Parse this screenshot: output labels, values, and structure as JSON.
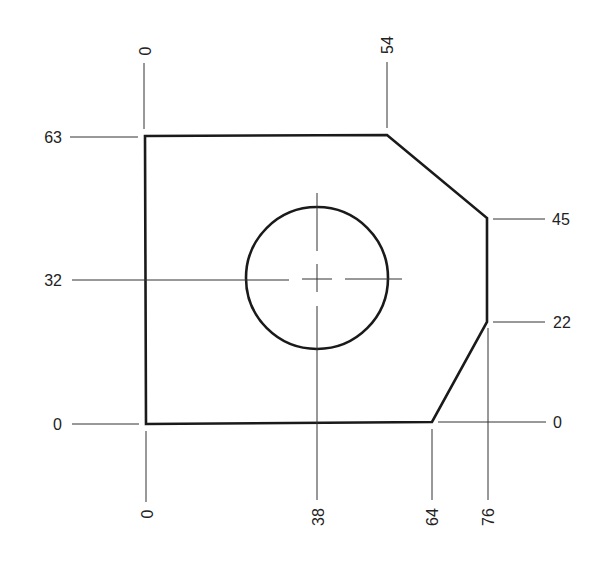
{
  "drawing": {
    "type": "ordinate-dimensioned part drawing",
    "units": "mm (implied)",
    "colors": {
      "outline": "#1a1a1a",
      "extension_lines": "#333333",
      "text": "#222222",
      "background": "#ffffff"
    },
    "top_labels": {
      "origin_x": "0",
      "chamfer_start_x": "54"
    },
    "left_labels": {
      "top_y": "63",
      "hole_center_y": "32",
      "origin_y": "0"
    },
    "right_labels": {
      "chamfer_end_y": "45",
      "lower_chamfer_y": "22",
      "origin_y": "0"
    },
    "bottom_labels": {
      "origin_x": "0",
      "hole_center_x": "38",
      "lower_chamfer_x": "64",
      "right_edge_x": "76"
    },
    "outline_points": [
      {
        "x": 0,
        "y": 0
      },
      {
        "x": 0,
        "y": 63
      },
      {
        "x": 54,
        "y": 63
      },
      {
        "x": 76,
        "y": 45
      },
      {
        "x": 76,
        "y": 22
      },
      {
        "x": 64,
        "y": 0
      }
    ],
    "hole": {
      "center_x": 38,
      "center_y": 32,
      "diameter_approx": 32
    }
  }
}
